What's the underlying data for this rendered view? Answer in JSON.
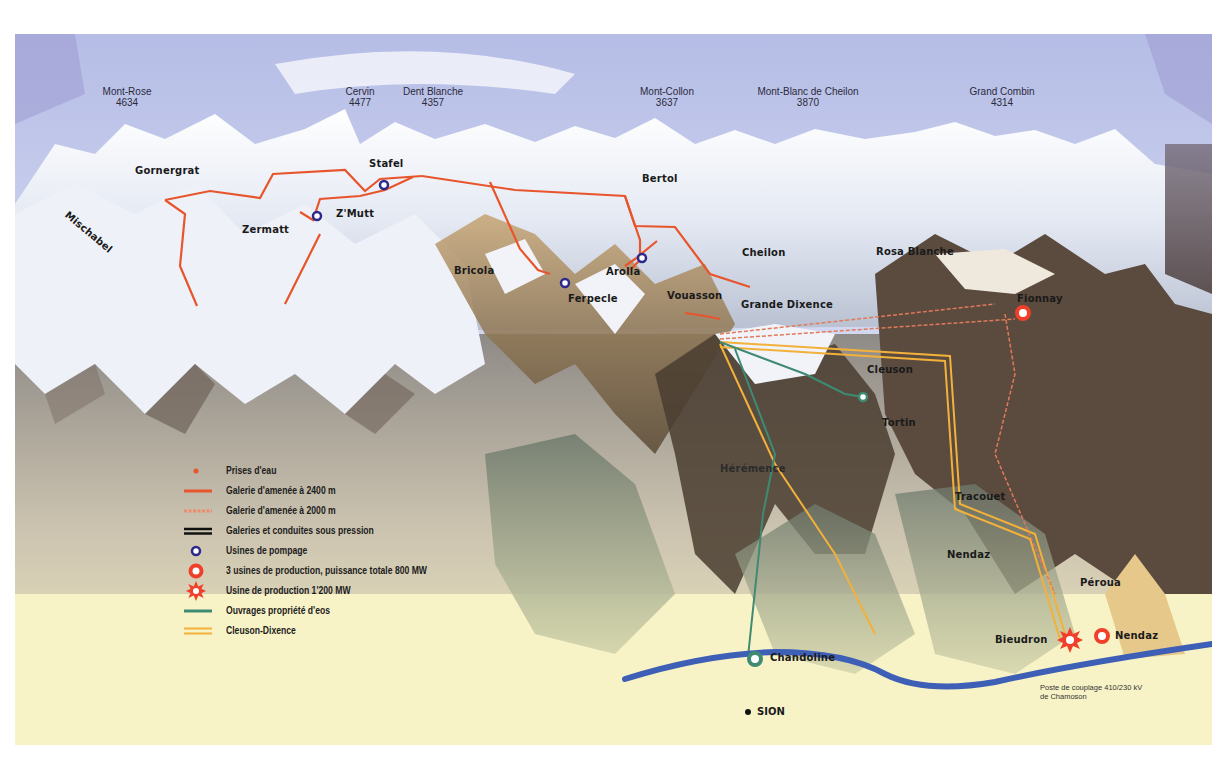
{
  "peaks": [
    {
      "name": "Mont-Rose",
      "altitude": "4634"
    },
    {
      "name": "Cervin",
      "altitude": "4477"
    },
    {
      "name": "Dent Blanche",
      "altitude": "4357"
    },
    {
      "name": "Mont-Collon",
      "altitude": "3637"
    },
    {
      "name": "Mont-Blanc de Cheilon",
      "altitude": "3870"
    },
    {
      "name": "Grand Combin",
      "altitude": "4314"
    }
  ],
  "places": {
    "gornergrat": "Gornergrat",
    "mischabel": "Mischabel",
    "stafel": "Stafel",
    "zmutt": "Z'Mutt",
    "zermatt": "Zermatt",
    "bertol": "Bertol",
    "bricola": "Bricola",
    "arolla": "Arolla",
    "ferpecle": "Ferpecle",
    "vouasson": "Vouasson",
    "cheilon": "Cheilon",
    "grande_dixence": "Grande Dixence",
    "rosa_blanche": "Rosa Blanche",
    "fionnay": "Fionnay",
    "cleuson": "Cleuson",
    "tortin": "Tortin",
    "heremence": "Hérémence",
    "tracouet": "Tracouet",
    "nendaz_village": "Nendaz",
    "péroua": "Péroua",
    "bieudron": "Bieudron",
    "nendaz_plant": "Nendaz",
    "chandoline": "Chandoline",
    "sion": "SION"
  },
  "substation_note": {
    "line1": "Poste de couplage 410/230 kV",
    "line2": "de Chamoson"
  },
  "legend": [
    {
      "symbol": "intake-dot",
      "label": "Prises d'eau"
    },
    {
      "symbol": "tunnel-2400",
      "label": "Galerie d'amenée à 2400 m"
    },
    {
      "symbol": "tunnel-2000",
      "label": "Galerie d'amenée à 2000 m"
    },
    {
      "symbol": "pressure-pipes",
      "label": "Galeries et conduites sous pression"
    },
    {
      "symbol": "pumping-station",
      "label": "Usines de pompage"
    },
    {
      "symbol": "production-plant",
      "label": "3 usines de production, puissance totale 800 MW"
    },
    {
      "symbol": "production-plant-large",
      "label": "Usine de production 1'200 MW"
    },
    {
      "symbol": "eos-works",
      "label": "Ouvrages propriété d'eos"
    },
    {
      "symbol": "cleuson-dixence",
      "label": "Cleuson-Dixence"
    }
  ],
  "colors": {
    "tunnel": "#e8552d",
    "pumping": "#2b2a8c",
    "plant": "#f0402a",
    "eos": "#3f8a73",
    "cleuson": "#f2b13a",
    "river": "#3d5fb5",
    "sky": "#c9d2ee",
    "valley": "#f7f1c4"
  }
}
